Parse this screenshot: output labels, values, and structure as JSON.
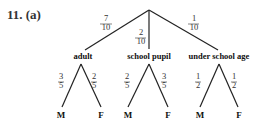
{
  "question": {
    "label": "11. (a)"
  },
  "tree": {
    "root": {
      "x": 149,
      "y": 10
    },
    "branches": [
      {
        "name": "adult",
        "label": "adult",
        "prob": {
          "num": "7",
          "den": "10"
        },
        "children": [
          {
            "label": "M",
            "prob": {
              "num": "3",
              "den": "5"
            }
          },
          {
            "label": "F",
            "prob": {
              "num": "2",
              "den": "5"
            }
          }
        ]
      },
      {
        "name": "school-pupil",
        "label": "school pupil",
        "prob": {
          "num": "2",
          "den": "10"
        },
        "children": [
          {
            "label": "M",
            "prob": {
              "num": "2",
              "den": "5"
            }
          },
          {
            "label": "F",
            "prob": {
              "num": "3",
              "den": "5"
            }
          }
        ]
      },
      {
        "name": "under-school-age",
        "label": "under school age",
        "prob": {
          "num": "1",
          "den": "10"
        },
        "children": [
          {
            "label": "M",
            "prob": {
              "num": "1",
              "den": "2"
            }
          },
          {
            "label": "F",
            "prob": {
              "num": "1",
              "den": "2"
            }
          }
        ]
      }
    ]
  }
}
